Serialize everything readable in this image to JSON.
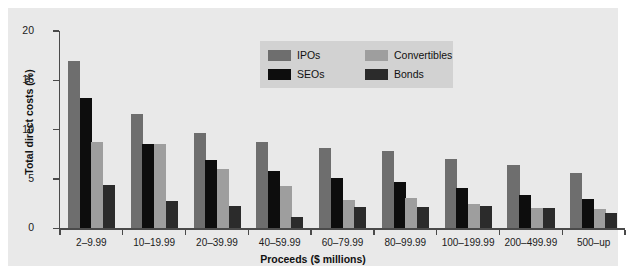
{
  "chart_data": {
    "type": "bar",
    "title": "",
    "xlabel": "Proceeds ($ millions)",
    "ylabel": "Total direct costs (%)",
    "ylim": [
      0,
      20
    ],
    "yticks": [
      0,
      5,
      10,
      15,
      20
    ],
    "grid": false,
    "legend_position": "top-center",
    "categories": [
      "2–9.99",
      "10–19.99",
      "20–39.99",
      "40–59.99",
      "60–79.99",
      "80–99.99",
      "100–199.99",
      "200–499.99",
      "500–up"
    ],
    "series": [
      {
        "name": "IPOs",
        "color": "#6e6e6e",
        "values": [
          17.0,
          11.6,
          9.7,
          8.8,
          8.1,
          7.8,
          7.0,
          6.4,
          5.6
        ]
      },
      {
        "name": "SEOs",
        "color": "#0d0d0d",
        "values": [
          13.2,
          8.6,
          6.9,
          5.8,
          5.1,
          4.7,
          4.1,
          3.4,
          3.0
        ]
      },
      {
        "name": "Convertibles",
        "color": "#9e9e9e",
        "values": [
          8.8,
          8.6,
          6.0,
          4.3,
          2.9,
          3.1,
          2.5,
          2.1,
          2.0
        ]
      },
      {
        "name": "Bonds",
        "color": "#2b2b2b",
        "values": [
          4.4,
          2.8,
          2.3,
          1.2,
          2.2,
          2.2,
          2.3,
          2.1,
          1.6
        ]
      }
    ]
  },
  "axes": {
    "ylabel": "Total direct costs (%)",
    "xlabel": "Proceeds ($ millions)",
    "ytick_labels": [
      "0",
      "5",
      "10",
      "15",
      "20"
    ],
    "xtick_labels": [
      "2–9.99",
      "10–19.99",
      "20–39.99",
      "40–59.99",
      "60–79.99",
      "80–99.99",
      "100–199.99",
      "200–499.99",
      "500–up"
    ]
  },
  "legend": {
    "entries": [
      {
        "label": "IPOs",
        "color": "#6e6e6e"
      },
      {
        "label": "SEOs",
        "color": "#0d0d0d"
      },
      {
        "label": "Convertibles",
        "color": "#9e9e9e"
      },
      {
        "label": "Bonds",
        "color": "#2b2b2b"
      }
    ],
    "background": "#d2d2d2"
  },
  "style": {
    "panel_background": "#e9e9e9",
    "figure_background": "#ffffff",
    "axis_color": "#4a4a4a"
  }
}
